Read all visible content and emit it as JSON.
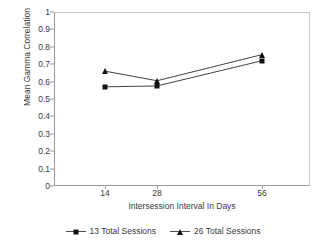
{
  "chart_data": {
    "type": "line",
    "title": "",
    "xlabel": "Intersession Interval In Days",
    "ylabel": "Mean Gamma Correlation",
    "categories": [
      "14",
      "28",
      "56"
    ],
    "x": [
      14,
      28,
      56
    ],
    "xtick_labels": [
      "14",
      "28",
      "56"
    ],
    "ytick_labels": [
      "0",
      "0.1",
      "0.2",
      "0.3",
      "0.4",
      "0.5",
      "0.6",
      "0.7",
      "0.8",
      "0.9",
      "1"
    ],
    "ytick_values": [
      0,
      0.1,
      0.2,
      0.3,
      0.4,
      0.5,
      0.6,
      0.7,
      0.8,
      0.9,
      1
    ],
    "ylim": [
      0,
      1
    ],
    "grid": false,
    "legend_position": "bottom-center",
    "series": [
      {
        "name": "13 Total Sessions",
        "marker": "square",
        "color": "#111111",
        "values": [
          0.57,
          0.575,
          0.72
        ]
      },
      {
        "name": "26 Total Sessions",
        "marker": "triangle",
        "color": "#111111",
        "values": [
          0.66,
          0.605,
          0.755
        ]
      }
    ]
  },
  "legend": {
    "entries": [
      {
        "label": "13 Total Sessions",
        "marker_icon": "square-marker-icon"
      },
      {
        "label": "26 Total Sessions",
        "marker_icon": "triangle-marker-icon"
      }
    ]
  },
  "colors": {
    "axis": "#9a9a9a",
    "frame": "#c9c9c9",
    "text": "#3a3a3a",
    "series": "#111111",
    "background": "#ffffff"
  }
}
